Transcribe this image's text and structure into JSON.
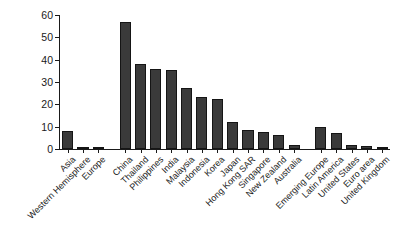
{
  "chart_data": {
    "type": "bar",
    "title": "",
    "subtitle": "",
    "xlabel": "",
    "ylabel": "",
    "ylim": [
      0,
      60
    ],
    "yticks": [
      0,
      10,
      20,
      30,
      40,
      50,
      60
    ],
    "grid": false,
    "legend": null,
    "bar_color": "#3a3a3a",
    "axis_color": "#1a1a1a",
    "background": "#ffffff",
    "categories": [
      "Asia",
      "Western Hemisphere",
      "Europe",
      "China",
      "Thailand",
      "Philippines",
      "India",
      "Malaysia",
      "Indonesia",
      "Korea",
      "Japan",
      "Hong Kong SAR",
      "Singapore",
      "New Zealand",
      "Australia",
      "Emerging Europe",
      "Latin America",
      "United States",
      "Euro area",
      "United Kingdom"
    ],
    "values": [
      8.0,
      0.9,
      0.8,
      56.8,
      38.0,
      35.8,
      35.2,
      27.2,
      23.4,
      22.5,
      12.0,
      8.7,
      7.6,
      6.3,
      1.9,
      9.8,
      7.0,
      1.8,
      1.4,
      0.5
    ],
    "group_breaks": [
      3,
      15
    ]
  }
}
